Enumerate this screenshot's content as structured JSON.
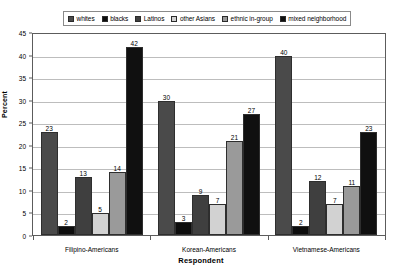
{
  "chart_data": {
    "type": "bar",
    "title": "",
    "xlabel": "Respondent",
    "ylabel": "Percent",
    "ylim": [
      0,
      45
    ],
    "ytick_step": 5,
    "yticks": [
      0,
      5,
      10,
      15,
      20,
      25,
      30,
      35,
      40,
      45
    ],
    "grid": true,
    "legend_position": "top",
    "categories": [
      "Filipino-Americans",
      "Korean-Americans",
      "Vietnamese-Americans"
    ],
    "series": [
      {
        "name": "whites",
        "color": "#4a4a4a",
        "values": [
          23,
          30,
          40
        ]
      },
      {
        "name": "blacks",
        "color": "#0d0d0d",
        "values": [
          2,
          3,
          2
        ]
      },
      {
        "name": "Latinos",
        "color": "#3f3f3f",
        "values": [
          13,
          9,
          12
        ]
      },
      {
        "name": "other Asians",
        "color": "#d2d2d2",
        "values": [
          5,
          7,
          7
        ]
      },
      {
        "name": "ethnic in-group",
        "color": "#9a9a9a",
        "values": [
          14,
          21,
          11
        ]
      },
      {
        "name": "mixed neighborhood",
        "color": "#101010",
        "values": [
          42,
          27,
          23
        ]
      }
    ]
  },
  "legend": {
    "items": [
      {
        "label": "whites"
      },
      {
        "label": "blacks"
      },
      {
        "label": "Latinos"
      },
      {
        "label": "other Asians"
      },
      {
        "label": "ethnic in-group"
      },
      {
        "label": "mixed neighborhood"
      }
    ]
  },
  "axes": {
    "y_title": "Percent",
    "x_title": "Respondent"
  },
  "colors": {
    "grid": "#bdbdbd",
    "axis": "#5c5c5c",
    "bar_outline": "#2e2e2e",
    "background": "#ffffff"
  }
}
